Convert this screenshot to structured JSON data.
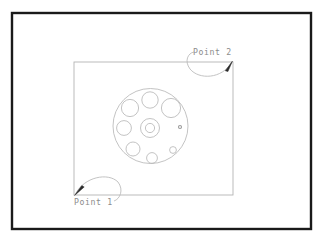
{
  "drawing": {
    "title": "CAD rectangle selection with circular flange part",
    "background_color": "#ffffff",
    "frame": {
      "name": "outer-frame",
      "color": "#1a1a1a",
      "stroke_width": 2.4,
      "x": 12,
      "y": 13,
      "width": 299,
      "height": 216
    },
    "selection_rectangle": {
      "name": "selection-rectangle",
      "color": "#b4b4b4",
      "stroke_width": 0.9,
      "x": 74,
      "y": 62,
      "width": 159,
      "height": 133
    },
    "labels": [
      {
        "id": "point-1",
        "text": "Point 1",
        "color": "#8c8c8c",
        "x": 74,
        "y": 205,
        "anchor_x": 75,
        "anchor_y": 195
      },
      {
        "id": "point-2",
        "text": "Point 2",
        "color": "#8c8c8c",
        "x": 193,
        "y": 55,
        "anchor_x": 232,
        "anchor_y": 62
      }
    ],
    "arrowheads": [
      {
        "id": "arrowhead-point-1",
        "color": "#222222",
        "tip_x": 75,
        "tip_y": 195,
        "direction": "down-left"
      },
      {
        "id": "arrowhead-point-2",
        "color": "#222222",
        "tip_x": 232,
        "tip_y": 62,
        "direction": "up-right"
      }
    ],
    "part": {
      "name": "circular-flange-part",
      "color": "#b8b8b8",
      "stroke_width": 0.85,
      "outer_circle": {
        "cx": 150.5,
        "cy": 126,
        "r": 37.5
      },
      "hub": [
        {
          "id": "hub-outer",
          "cx": 150,
          "cy": 128,
          "r": 9.5
        },
        {
          "id": "hub-bore",
          "cx": 150,
          "cy": 128,
          "r": 4.6
        }
      ],
      "bolt_holes": [
        {
          "id": "hole-top",
          "cx": 150,
          "cy": 100,
          "r": 8.2
        },
        {
          "id": "hole-upper-left",
          "cx": 130,
          "cy": 108,
          "r": 8.6
        },
        {
          "id": "hole-upper-right",
          "cx": 171,
          "cy": 108,
          "r": 9.6
        },
        {
          "id": "hole-left",
          "cx": 124,
          "cy": 128,
          "r": 7.4
        },
        {
          "id": "hole-lower-left",
          "cx": 133,
          "cy": 149,
          "r": 7.0
        },
        {
          "id": "hole-bottom",
          "cx": 152,
          "cy": 158,
          "r": 5.4
        },
        {
          "id": "hole-small-right",
          "cx": 173,
          "cy": 150,
          "r": 3.4
        },
        {
          "id": "mark-right",
          "cx": 180,
          "cy": 127,
          "r": 1.5
        }
      ]
    }
  }
}
